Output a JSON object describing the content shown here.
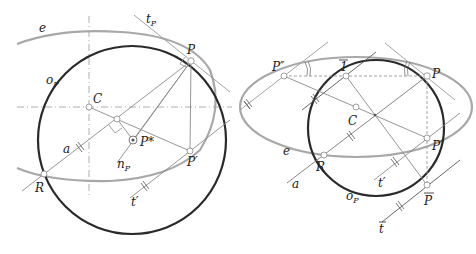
{
  "figure": {
    "left": {
      "labels": {
        "e": "e",
        "tP": "t",
        "tP_sub": "P",
        "P": "P",
        "oP": "o",
        "oP_sub": "P",
        "C": "C",
        "Pstar": "P*",
        "nP": "n",
        "nP_sub": "P",
        "Pprime": "P′",
        "a": "a",
        "R": "R",
        "tprime": "t′"
      }
    },
    "right": {
      "labels": {
        "Pdbl": "P″",
        "one_bar": "1",
        "P": "P",
        "C": "C",
        "Pprime": "P′",
        "e": "e",
        "R": "R",
        "a": "a",
        "tprime": "t′",
        "oP": "o",
        "oP_sub": "P",
        "Pbar": "P",
        "tbar": "t"
      }
    },
    "colors": {
      "circle": "#2a2a2a",
      "ellipse": "#a8a8a8",
      "construction": "#8a8a8a",
      "axis": "#9a9a9a",
      "point_fill": "#ffffff"
    }
  }
}
